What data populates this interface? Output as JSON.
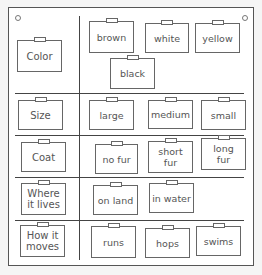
{
  "board": {
    "title": "Animal attributes sorting board",
    "rows": [
      {
        "category": "Color",
        "values": [
          "brown",
          "white",
          "yellow",
          "black"
        ]
      },
      {
        "category": "Size",
        "values": [
          "large",
          "medium",
          "small"
        ]
      },
      {
        "category": "Coat",
        "values": [
          "no fur",
          "short fur",
          "long fur"
        ]
      },
      {
        "category": "Where it lives",
        "values": [
          "on land",
          "in water"
        ]
      },
      {
        "category": "How it moves",
        "values": [
          "runs",
          "hops",
          "swims"
        ]
      }
    ]
  },
  "labels": {
    "color": "Color",
    "brown": "brown",
    "white": "white",
    "yellow": "yellow",
    "black": "black",
    "size": "Size",
    "large": "large",
    "medium": "medium",
    "small": "small",
    "coat": "Coat",
    "no_fur": "no fur",
    "short_fur_1": "short",
    "short_fur_2": "fur",
    "long_fur_1": "long",
    "long_fur_2": "fur",
    "where_1": "Where",
    "where_2": "it lives",
    "on_land": "on land",
    "in_water": "in water",
    "how_1": "How it",
    "how_2": "moves",
    "runs": "runs",
    "hops": "hops",
    "swims": "swims"
  }
}
